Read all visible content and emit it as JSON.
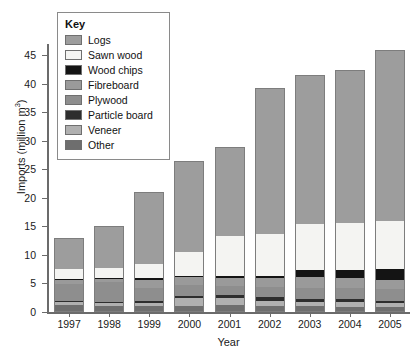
{
  "chart_data": {
    "type": "bar",
    "subtype": "stacked",
    "title": "",
    "xlabel": "Year",
    "ylabel": "Imports (million m³)",
    "ylim": [
      0,
      47
    ],
    "yticks": [
      0,
      5,
      10,
      15,
      20,
      25,
      30,
      35,
      40,
      45
    ],
    "ytick_labels": [
      "0",
      "5",
      "10",
      "15",
      "20",
      "25",
      "30",
      "35",
      "40",
      "45"
    ],
    "grid": false,
    "legend_position": "top-left",
    "legend_title": "Key",
    "categories": [
      "1997",
      "1998",
      "1999",
      "2000",
      "2001",
      "2002",
      "2003",
      "2004",
      "2005"
    ],
    "series": [
      {
        "name": "Other",
        "color": "#6e6e6e",
        "values": [
          1.3,
          1.1,
          1.0,
          1.0,
          1.2,
          1.1,
          1.0,
          0.9,
          0.8
        ]
      },
      {
        "name": "Veneer",
        "color": "#b0b0b0",
        "values": [
          0.4,
          0.4,
          0.5,
          1.4,
          1.3,
          0.9,
          0.8,
          0.8,
          0.7
        ]
      },
      {
        "name": "Particle board",
        "color": "#2e2e2e",
        "values": [
          0.3,
          0.3,
          0.5,
          0.5,
          0.5,
          0.6,
          0.5,
          0.5,
          0.5
        ]
      },
      {
        "name": "Plywood",
        "color": "#8e8e8e",
        "values": [
          3.0,
          3.4,
          2.2,
          1.9,
          1.5,
          1.8,
          2.0,
          2.0,
          2.0
        ]
      },
      {
        "name": "Fibreboard",
        "color": "#9a9a9a",
        "values": [
          0.6,
          0.6,
          1.4,
          1.3,
          1.4,
          1.6,
          1.8,
          1.8,
          1.7
        ]
      },
      {
        "name": "Wood chips",
        "color": "#141414",
        "values": [
          0.2,
          0.2,
          0.3,
          0.3,
          0.4,
          0.4,
          1.2,
          1.3,
          1.8
        ]
      },
      {
        "name": "Sawn wood",
        "color": "#f4f4f2",
        "values": [
          1.8,
          1.7,
          2.5,
          4.1,
          7.0,
          7.3,
          8.2,
          8.4,
          8.5
        ]
      },
      {
        "name": "Logs",
        "color": "#9d9d9d",
        "values": [
          5.4,
          7.3,
          12.6,
          16.0,
          15.7,
          25.6,
          26.0,
          26.8,
          30.0
        ]
      }
    ],
    "totals": [
      13.0,
      15.0,
      21.0,
      26.5,
      29.0,
      39.3,
      41.5,
      42.5,
      46.0
    ],
    "legend_order": [
      "Logs",
      "Sawn wood",
      "Wood chips",
      "Fibreboard",
      "Plywood",
      "Particle board",
      "Veneer",
      "Other"
    ],
    "legend_colors": {
      "Logs": "#9d9d9d",
      "Sawn wood": "#f4f4f2",
      "Wood chips": "#141414",
      "Fibreboard": "#9a9a9a",
      "Plywood": "#8e8e8e",
      "Particle board": "#2e2e2e",
      "Veneer": "#b0b0b0",
      "Other": "#6e6e6e"
    }
  }
}
